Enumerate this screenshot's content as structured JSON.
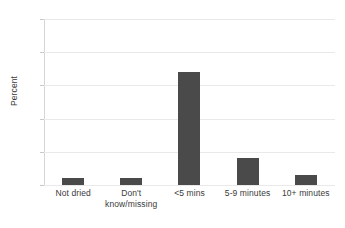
{
  "chart_data": {
    "type": "bar",
    "title": "",
    "subtitle": "",
    "xlabel": "",
    "ylabel": "Percent",
    "categories": [
      "Not dried",
      "Don't\nknow/missing",
      "<5 mins",
      "5-9 minutes",
      "10+ minutes"
    ],
    "values": [
      4,
      4,
      68,
      16,
      6
    ],
    "ylim": [
      0,
      100
    ],
    "yticks": [
      0,
      20,
      40,
      60,
      80,
      100
    ],
    "ytick_labels": [
      "0",
      "20",
      "40",
      "60",
      "80",
      "100"
    ],
    "grid": true,
    "grid_axis": "y",
    "legend": false,
    "legend_position": "none",
    "series": [
      {
        "name": "Percent",
        "values": [
          4,
          4,
          68,
          16,
          6
        ],
        "color": "#4a4a4a"
      }
    ]
  },
  "style": {
    "bar_color": "#4a4a4a",
    "grid_color": "#e9e9e9",
    "axis_color": "#d6d6d6",
    "text_color": "#3a3a3a",
    "background": "#ffffff"
  }
}
